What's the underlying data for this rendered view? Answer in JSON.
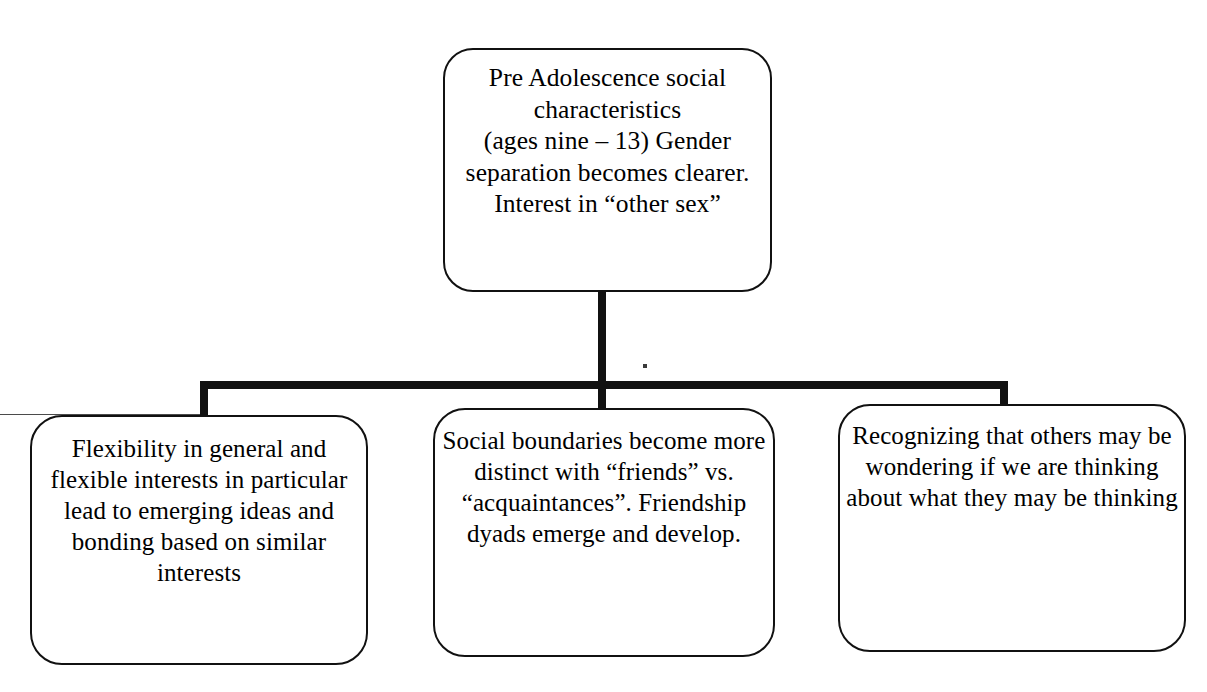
{
  "diagram": {
    "type": "hierarchy-tree",
    "orientation": "top-down",
    "title": "Pre Adolescence social characteristics",
    "colors": {
      "background": "#ffffff",
      "stroke": "#111111",
      "text": "#000000"
    },
    "root": {
      "id": "root",
      "label": "Pre Adolescence  social characteristics\n(ages nine – 13) Gender separation becomes clearer.\nInterest in “other sex”"
    },
    "children": [
      {
        "id": "left",
        "label": "Flexibility in general and flexible interests in particular lead to emerging ideas and bonding based on similar interests"
      },
      {
        "id": "middle",
        "label": "Social boundaries become more distinct with “friends” vs. “acquaintances”. Friendship dyads emerge and develop."
      },
      {
        "id": "right",
        "label": "Recognizing that others may be wondering if we are thinking about what they may be thinking"
      }
    ],
    "connectors": {
      "trunk_label": "root-to-bus-connector",
      "bus_label": "horizontal-distribution-bus",
      "drops": [
        "drop-to-left-child",
        "drop-to-middle-child",
        "drop-to-right-child"
      ]
    }
  }
}
